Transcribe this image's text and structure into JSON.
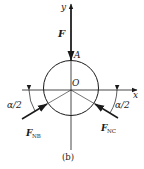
{
  "figure": {
    "caption": "(b)",
    "axes": {
      "x_label": "x",
      "y_label": "y"
    },
    "points": {
      "origin_label": "O",
      "contact_label": "A"
    },
    "forces": {
      "applied": {
        "symbol": "F",
        "subscript": ""
      },
      "normal_b": {
        "symbol": "F",
        "subscript": "NB"
      },
      "normal_c": {
        "symbol": "F",
        "subscript": "NC"
      }
    },
    "angles": {
      "left": "α/2",
      "right": "α/2"
    },
    "colors": {
      "stroke": "#1a1a1a",
      "background": "#ffffff"
    }
  }
}
